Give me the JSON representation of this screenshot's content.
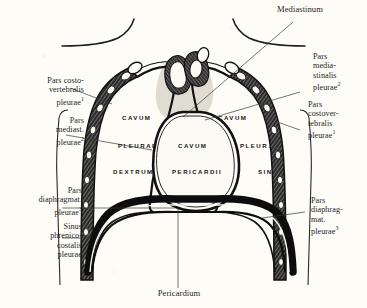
{
  "figure": {
    "background_color": "#fdfcf7",
    "ink_color": "#1f1f1f"
  },
  "callouts": {
    "mediastinum": "Mediastinum",
    "pericardium": "Pericardium",
    "left_costovertebralis": "Pars costo-\nvertebralis\npleurae",
    "left_costovertebralis_sup": "1",
    "left_mediastinalis": "Pars\nmediast.\npleurae",
    "left_mediastinalis_sup": "2",
    "left_diaphragmatica": "Pars\ndiaphragmat.\npleurae",
    "left_diaphragmatica_sup": "3",
    "left_sinus": "Sinus\nphrenico-\ncostalis\npleurae",
    "right_mediastinalis": "Pars\nmedia-\nstinalis\npleurae",
    "right_mediastinalis_sup": "2",
    "right_costovertebralis": "Pars\ncostover-\ntebralis\npleurae",
    "right_costovertebralis_sup": "1",
    "right_diaphragmatica": "Pars\ndiaphrag-\nmat.\npleurae",
    "right_diaphragmatica_sup": "3"
  },
  "interior_labels": {
    "cavum_left_1": "CAVUM",
    "cavum_left_2": "PLEURAE",
    "cavum_left_3": "DEXTRUM",
    "cavum_center_1": "CAVUM",
    "cavum_center_2": "PERICARDII",
    "cavum_right_1": "CAVUM",
    "cavum_right_2": "PLEUR.",
    "cavum_right_3": "SIN."
  }
}
